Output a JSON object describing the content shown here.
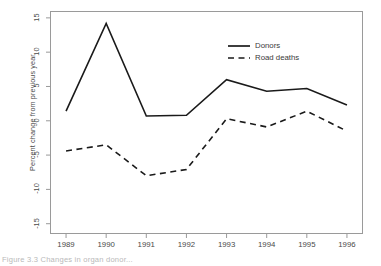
{
  "chart_data": {
    "type": "line",
    "title": "",
    "xlabel": "",
    "ylabel": "Percent change from previous year",
    "categories": [
      "1989",
      "1990",
      "1991",
      "1992",
      "1993",
      "1994",
      "1995",
      "1996"
    ],
    "x": [
      1989,
      1990,
      1991,
      1992,
      1993,
      1994,
      1995,
      1996
    ],
    "xlim": [
      1988.6,
      1996.4
    ],
    "ylim": [
      -16.5,
      16.0
    ],
    "yticks": [
      15,
      10,
      5,
      0,
      -5,
      -10,
      -15
    ],
    "ytick_labels": [
      "15",
      "10",
      "5",
      "0",
      "-5",
      "-10",
      "-15"
    ],
    "xticks": [
      1989,
      1990,
      1991,
      1992,
      1993,
      1994,
      1995,
      1996
    ],
    "grid": false,
    "legend_position": "upper-right-inside",
    "series": [
      {
        "name": "Donors",
        "style": "solid",
        "color": "#1a1a1a",
        "values": [
          1.4,
          14.2,
          0.7,
          0.8,
          6.0,
          4.3,
          4.7,
          2.3
        ]
      },
      {
        "name": "Road deaths",
        "style": "dashed",
        "color": "#1a1a1a",
        "values": [
          -4.4,
          -3.5,
          -8.0,
          -7.1,
          0.3,
          -0.9,
          1.4,
          -1.5
        ]
      }
    ]
  },
  "legend": {
    "items": [
      {
        "label": "Donors",
        "key": "solid-line-key"
      },
      {
        "label": "Road deaths",
        "key": "dashed-line-key"
      }
    ]
  },
  "caption": {
    "text": "Figure 3.3  Changes in organ donor..."
  }
}
